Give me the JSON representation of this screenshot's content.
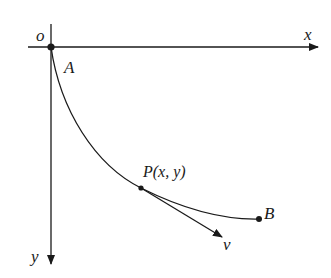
{
  "diagram": {
    "type": "brachistochrone-curve",
    "labels": {
      "origin": "o",
      "x_axis": "x",
      "y_axis": "y",
      "point_a": "A",
      "point_p": "P(x, y)",
      "point_b": "B",
      "velocity": "v"
    },
    "colors": {
      "stroke": "#1a1a1a",
      "background": "#ffffff"
    }
  }
}
